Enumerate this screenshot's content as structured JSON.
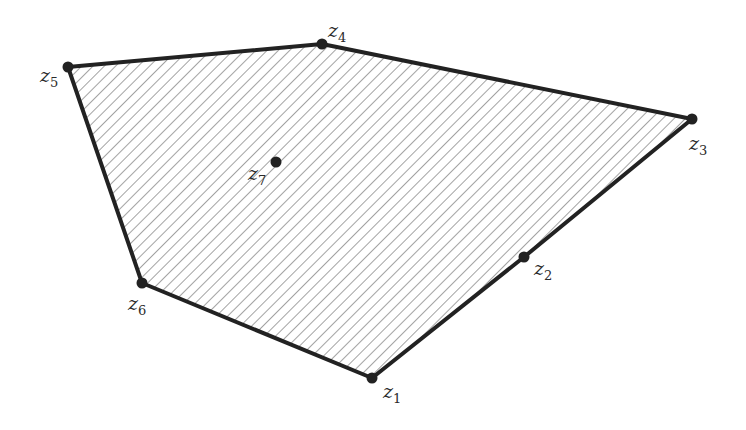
{
  "diagram": {
    "colors": {
      "edge": "#222222",
      "hatch": "#555555",
      "vertex": "#222222",
      "label": "#2a2a2a"
    },
    "polygon_order": [
      "z1",
      "z2",
      "z3",
      "z4",
      "z5",
      "z6"
    ],
    "points": [
      {
        "id": "z1",
        "label": "z",
        "sub": "1",
        "role": "boundary"
      },
      {
        "id": "z2",
        "label": "z",
        "sub": "2",
        "role": "boundary-edge"
      },
      {
        "id": "z3",
        "label": "z",
        "sub": "3",
        "role": "boundary"
      },
      {
        "id": "z4",
        "label": "z",
        "sub": "4",
        "role": "boundary"
      },
      {
        "id": "z5",
        "label": "z",
        "sub": "5",
        "role": "boundary"
      },
      {
        "id": "z6",
        "label": "z",
        "sub": "6",
        "role": "boundary"
      },
      {
        "id": "z7",
        "label": "z",
        "sub": "7",
        "role": "interior"
      }
    ]
  }
}
